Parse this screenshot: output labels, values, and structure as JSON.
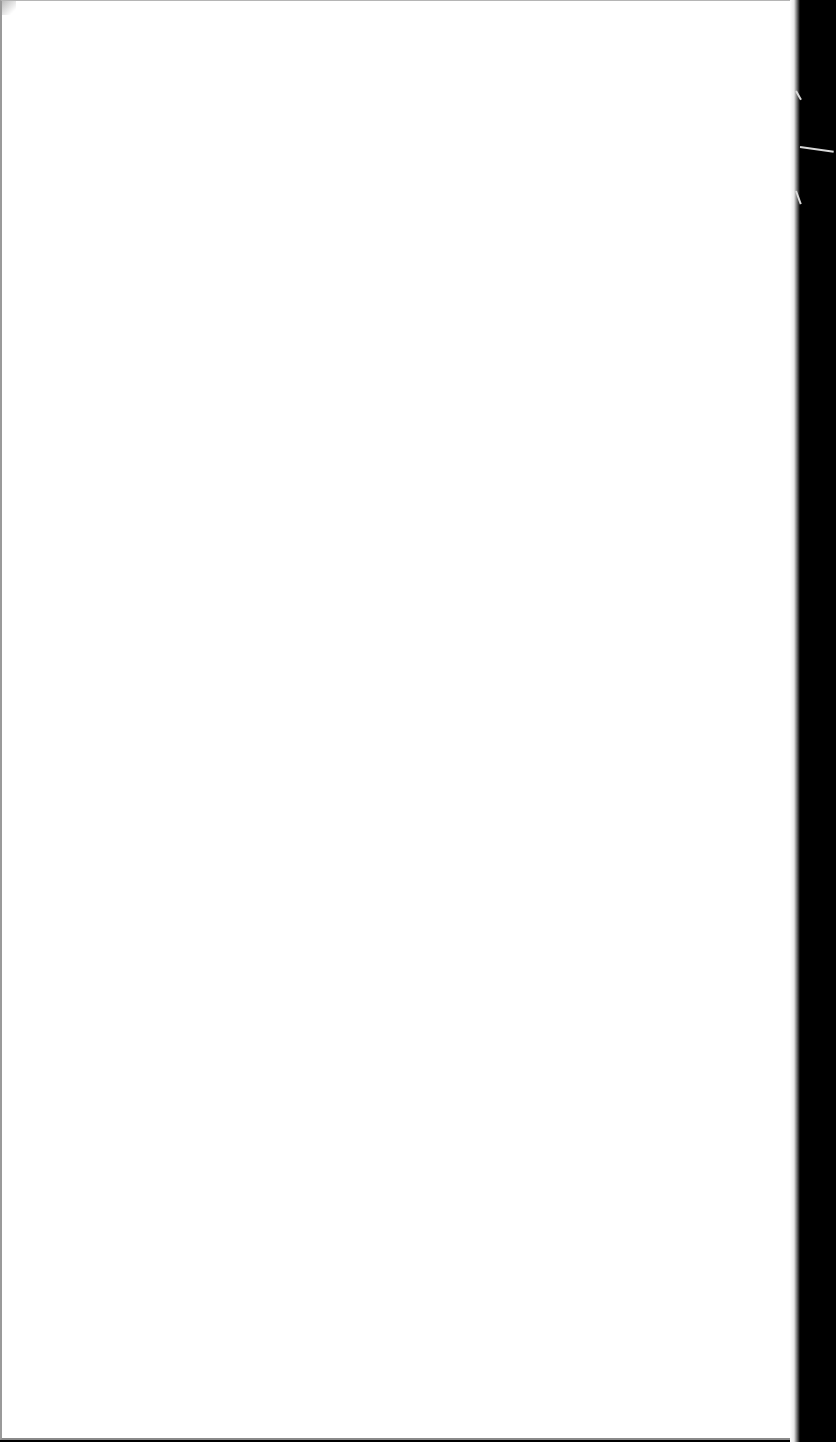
{
  "document": {
    "type": "scanned-page",
    "content": "",
    "colors": {
      "paper": "#ffffff",
      "background": "#000000",
      "edge": "#9a9a9a"
    }
  }
}
